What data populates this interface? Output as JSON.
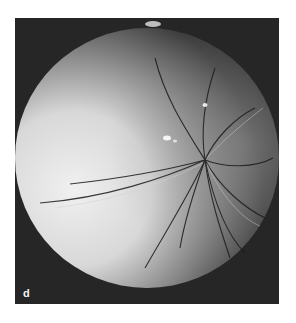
{
  "figure": {
    "panel_label": "d",
    "colors": {
      "background": "#262626",
      "sphere_highlight": "#e8e8e8",
      "sphere_shadow": "#3a3a3a",
      "page": "#ffffff"
    }
  }
}
